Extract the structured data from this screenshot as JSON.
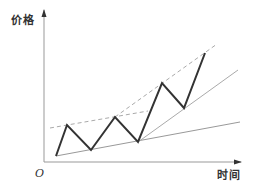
{
  "chart_data": {
    "type": "line",
    "title": "",
    "xlabel": "时间",
    "ylabel": "价格",
    "origin_label": "O",
    "grid": false,
    "axes": {
      "origin": [
        44,
        162
      ],
      "x_end": [
        241,
        162
      ],
      "y_end": [
        44,
        10
      ],
      "color": "#999999"
    },
    "series": [
      {
        "name": "price-zigzag",
        "style": "solid",
        "color": "#333333",
        "width": 2,
        "points": [
          [
            56,
            156
          ],
          [
            67,
            125
          ],
          [
            91,
            150
          ],
          [
            115,
            117
          ],
          [
            138,
            142
          ],
          [
            162,
            83
          ],
          [
            184,
            108
          ],
          [
            205,
            53
          ]
        ]
      },
      {
        "name": "upper-trendline-shallow",
        "style": "dashed",
        "color": "#aaaaaa",
        "width": 1,
        "points": [
          [
            50,
            128
          ],
          [
            148,
            111
          ]
        ]
      },
      {
        "name": "upper-trendline-steep",
        "style": "dashed",
        "color": "#aaaaaa",
        "width": 1,
        "points": [
          [
            115,
            117
          ],
          [
            217,
            44
          ]
        ]
      },
      {
        "name": "lower-trendline-shallow",
        "style": "solid",
        "color": "#999999",
        "width": 1,
        "points": [
          [
            56,
            156
          ],
          [
            240,
            122
          ]
        ]
      },
      {
        "name": "lower-trendline-steep",
        "style": "solid",
        "color": "#aaaaaa",
        "width": 1,
        "points": [
          [
            138,
            142
          ],
          [
            238,
            70
          ]
        ]
      }
    ]
  }
}
